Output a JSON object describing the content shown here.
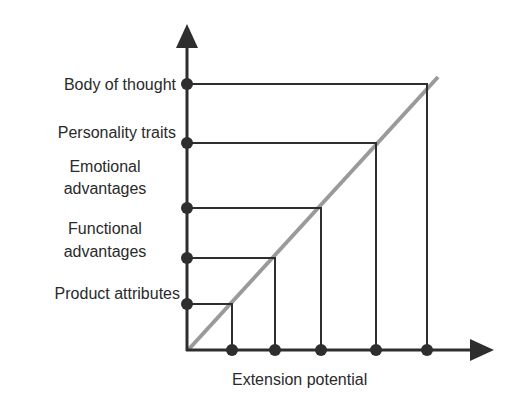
{
  "diagram": {
    "x_axis_label": "Extension potential",
    "y_levels": [
      {
        "label_lines": [
          "Product attributes"
        ],
        "x": 232,
        "y": 304
      },
      {
        "label_lines": [
          "Functional",
          "advantages"
        ],
        "x": 275,
        "y": 258
      },
      {
        "label_lines": [
          "Emotional",
          "advantages"
        ],
        "x": 321,
        "y": 208
      },
      {
        "label_lines": [
          "Personality traits"
        ],
        "x": 376,
        "y": 143
      },
      {
        "label_lines": [
          "Body of thought"
        ],
        "x": 427,
        "y": 84
      }
    ],
    "colors": {
      "axis": "#2e2e2e",
      "diagonal": "#9a9a9a",
      "text": "#2a2a2a"
    }
  },
  "labels": {
    "product_attributes": "Product attributes",
    "functional_1": "Functional",
    "functional_2": "advantages",
    "emotional_1": "Emotional",
    "emotional_2": "advantages",
    "personality": "Personality traits",
    "body": "Body of thought",
    "x_axis": "Extension potential"
  }
}
